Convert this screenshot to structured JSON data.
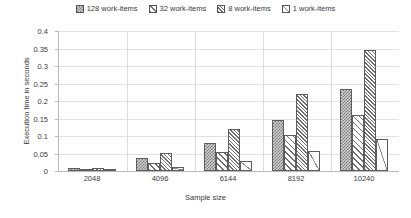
{
  "chart_data": {
    "type": "bar",
    "title": "",
    "xlabel": "Sample size",
    "ylabel": "Execution time in seconds",
    "categories": [
      "2048",
      "4096",
      "6144",
      "8192",
      "10240"
    ],
    "ylim": [
      0,
      0.4
    ],
    "yticks": [
      "0",
      "0.05",
      "0.1",
      "0.15",
      "0.2",
      "0.25",
      "0.3",
      "0.35",
      "0.4"
    ],
    "ytick_values": [
      0,
      0.05,
      0.1,
      0.15,
      0.2,
      0.25,
      0.3,
      0.35,
      0.4
    ],
    "grid": true,
    "legend_position": "top-center",
    "series": [
      {
        "name": "128 work-items",
        "pattern": "checkered-stipple",
        "values": [
          0.008,
          0.036,
          0.079,
          0.145,
          0.234
        ]
      },
      {
        "name": "32 work-items",
        "pattern": "wide-diagonal-hatch",
        "values": [
          0.005,
          0.024,
          0.054,
          0.102,
          0.16
        ]
      },
      {
        "name": "8 work-items",
        "pattern": "dense-diagonal-hatch",
        "values": [
          0.01,
          0.052,
          0.121,
          0.219,
          0.345
        ]
      },
      {
        "name": "1 work-items",
        "pattern": "white-single-diagonal",
        "values": [
          0.001,
          0.011,
          0.029,
          0.058,
          0.092
        ]
      }
    ]
  },
  "colors": {
    "background": "#ffffff",
    "text": "#3a3a3a",
    "gridline": "#e2e2e2",
    "axis": "#b9b9b9",
    "bar_border": "#5d5d5d",
    "pattern_ink": "#6e6e6e"
  }
}
